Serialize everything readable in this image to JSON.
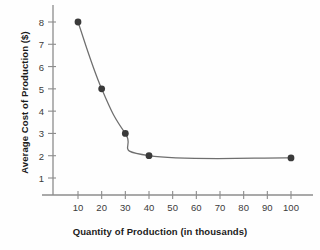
{
  "chart_data": {
    "type": "line",
    "title": "",
    "xlabel": "Quantity of Production (in thousands)",
    "ylabel": "Average Cost of Production ($)",
    "x": [
      10,
      20,
      30,
      40,
      100
    ],
    "values": [
      8,
      5,
      3,
      2,
      1.9
    ],
    "series": [
      {
        "name": "Average Cost of Production",
        "x": [
          10,
          20,
          30,
          40,
          100
        ],
        "values": [
          8,
          5,
          3,
          2,
          1.9
        ]
      }
    ],
    "xlim": [
      0,
      108
    ],
    "ylim": [
      0,
      8.8
    ],
    "xticks": [
      10,
      20,
      30,
      40,
      50,
      60,
      70,
      80,
      90,
      100
    ],
    "yticks": [
      1,
      2,
      3,
      4,
      5,
      6,
      7,
      8
    ],
    "xtick_labels": [
      "10",
      "20",
      "30",
      "40",
      "50",
      "60",
      "70",
      "80",
      "90",
      "100"
    ],
    "ytick_labels": [
      "1",
      "2",
      "3",
      "4",
      "5",
      "6",
      "7",
      "8"
    ],
    "grid": false,
    "legend": null,
    "marker": "circle",
    "colors": {
      "background": "#fefefe",
      "axis": "#8c8c8c",
      "line": "#6e6e6e",
      "marker": "#3a3a3a",
      "label_text": "#1b1b1b",
      "tick_text": "#3b3b3b"
    }
  }
}
